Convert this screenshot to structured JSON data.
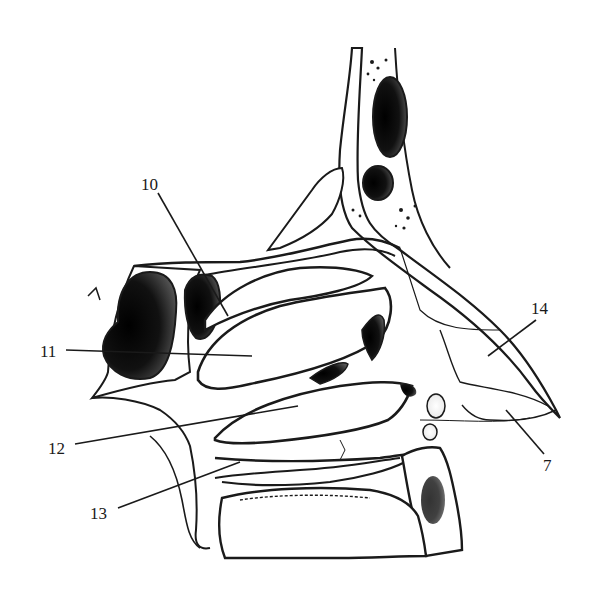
{
  "figure": {
    "labels": [
      {
        "id": "10",
        "text": "10",
        "x": 141,
        "y": 176
      },
      {
        "id": "11",
        "text": "11",
        "x": 40,
        "y": 343
      },
      {
        "id": "12",
        "text": "12",
        "x": 48,
        "y": 440
      },
      {
        "id": "13",
        "text": "13",
        "x": 90,
        "y": 505
      },
      {
        "id": "14",
        "text": "14",
        "x": 531,
        "y": 300
      },
      {
        "id": "7",
        "text": "7",
        "x": 543,
        "y": 457
      }
    ],
    "colors": {
      "ink": "#1a1a1a",
      "background": "#ffffff",
      "shade": "#2a2a2a"
    }
  }
}
